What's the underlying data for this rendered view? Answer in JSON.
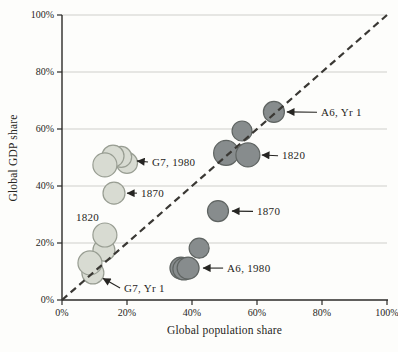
{
  "figure": {
    "background": "#fdfdfb",
    "text_color": "#262522",
    "axis_color": "#2b2a28"
  },
  "chart_data": {
    "type": "scatter",
    "title": "",
    "xlabel": "Global population share",
    "ylabel": "Global GDP share",
    "xlim": [
      0,
      100
    ],
    "ylim": [
      0,
      100
    ],
    "x_ticks": [
      {
        "v": 0,
        "label": "0%"
      },
      {
        "v": 20,
        "label": "20%"
      },
      {
        "v": 40,
        "label": "40%"
      },
      {
        "v": 60,
        "label": "60%"
      },
      {
        "v": 80,
        "label": "80%"
      },
      {
        "v": 100,
        "label": "100%"
      }
    ],
    "y_ticks": [
      {
        "v": 0,
        "label": "0%"
      },
      {
        "v": 20,
        "label": "20%"
      },
      {
        "v": 40,
        "label": "40%"
      },
      {
        "v": 60,
        "label": "60%"
      },
      {
        "v": 80,
        "label": "80%"
      },
      {
        "v": 100,
        "label": "100%"
      }
    ],
    "grid": {
      "horizontal": [
        20,
        40,
        60,
        80,
        100
      ],
      "color": "#c9c9c5"
    },
    "identity_line": {
      "from": [
        0,
        0
      ],
      "to": [
        100,
        100
      ],
      "style": "dashed",
      "color": "#3a3834"
    },
    "series": [
      {
        "name": "A6",
        "fill": "#878c8d",
        "stroke": "#5f6462",
        "points": [
          {
            "x": 65.2,
            "y": 66.0,
            "r": 10.5,
            "label": "A6, Yr 1"
          },
          {
            "x": 55.4,
            "y": 59.3,
            "r": 10
          },
          {
            "x": 50.5,
            "y": 51.6,
            "r": 12.5
          },
          {
            "x": 57.2,
            "y": 50.9,
            "r": 12,
            "label": "1820"
          },
          {
            "x": 48.0,
            "y": 31.2,
            "r": 10.5,
            "label": "1870"
          },
          {
            "x": 42.2,
            "y": 18.2,
            "r": 10
          },
          {
            "x": 36.6,
            "y": 11.2,
            "r": 11
          },
          {
            "x": 37.5,
            "y": 10.9,
            "r": 11
          },
          {
            "x": 38.8,
            "y": 11.2,
            "r": 11,
            "label": "A6, 1980"
          }
        ]
      },
      {
        "name": "G7",
        "fill": "#d8dbd2",
        "stroke": "#989d92",
        "points": [
          {
            "x": 20.0,
            "y": 48.1,
            "r": 10.5,
            "label": "G7, 1980"
          },
          {
            "x": 18.2,
            "y": 50.2,
            "r": 10.5
          },
          {
            "x": 15.7,
            "y": 50.5,
            "r": 11
          },
          {
            "x": 13.2,
            "y": 47.4,
            "r": 12
          },
          {
            "x": 16.0,
            "y": 37.5,
            "r": 11,
            "label": "1870"
          },
          {
            "x": 12.9,
            "y": 17.5,
            "r": 11,
            "label": "1820"
          },
          {
            "x": 13.2,
            "y": 22.8,
            "r": 12
          },
          {
            "x": 9.5,
            "y": 9.5,
            "r": 11,
            "label": "G7, Yr 1"
          },
          {
            "x": 8.6,
            "y": 13.0,
            "r": 12
          }
        ]
      }
    ],
    "annotations": [
      {
        "text": "A6, Yr 1",
        "lx": 79.7,
        "ly": 65.9,
        "tx": 69.2,
        "ty": 66.0,
        "arrow": true
      },
      {
        "text": "1820",
        "lx": 67.7,
        "ly": 50.6,
        "tx": 61.5,
        "ty": 50.9,
        "arrow": true
      },
      {
        "text": "1870",
        "lx": 60.0,
        "ly": 31.1,
        "tx": 52.3,
        "ty": 31.2,
        "arrow": true
      },
      {
        "text": "A6, 1980",
        "lx": 50.8,
        "ly": 11.2,
        "tx": 43.4,
        "ty": 11.2,
        "arrow": true
      },
      {
        "text": "G7, 1980",
        "lx": 27.7,
        "ly": 48.4,
        "tx": 23.1,
        "ty": 48.8,
        "arrow": true
      },
      {
        "text": "1870",
        "lx": 24.3,
        "ly": 37.5,
        "tx": 20.0,
        "ty": 37.5,
        "arrow": true
      },
      {
        "text": "1820",
        "lx": 4.3,
        "ly": 28.8,
        "arrow": false
      },
      {
        "text": "G7, Yr 1",
        "lx": 19.1,
        "ly": 4.2,
        "tx": 12.6,
        "ty": 7.6,
        "arrow": true
      }
    ]
  }
}
